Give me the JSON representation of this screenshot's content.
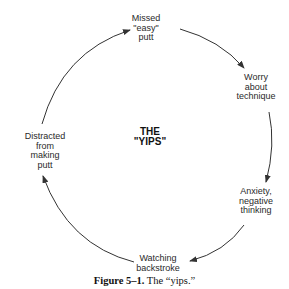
{
  "diagram": {
    "center_label": [
      "THE",
      "\"YIPS\""
    ],
    "nodes": [
      {
        "id": "missed-putt",
        "lines": [
          "Missed",
          "\"easy\"",
          "putt"
        ]
      },
      {
        "id": "worry-technique",
        "lines": [
          "Worry",
          "about",
          "technique"
        ]
      },
      {
        "id": "anxiety",
        "lines": [
          "Anxiety,",
          "negative",
          "thinking"
        ]
      },
      {
        "id": "watching-backstroke",
        "lines": [
          "Watching",
          "backstroke"
        ]
      },
      {
        "id": "distracted",
        "lines": [
          "Distracted",
          "from",
          "making",
          "putt"
        ]
      }
    ],
    "edges": [
      {
        "from": "missed-putt",
        "to": "worry-technique"
      },
      {
        "from": "worry-technique",
        "to": "anxiety"
      },
      {
        "from": "anxiety",
        "to": "watching-backstroke"
      },
      {
        "from": "watching-backstroke",
        "to": "distracted"
      },
      {
        "from": "distracted",
        "to": "missed-putt"
      }
    ],
    "line_color": "#333333"
  },
  "caption": {
    "label": "Figure 5–1.",
    "text": " The “yips.”"
  }
}
